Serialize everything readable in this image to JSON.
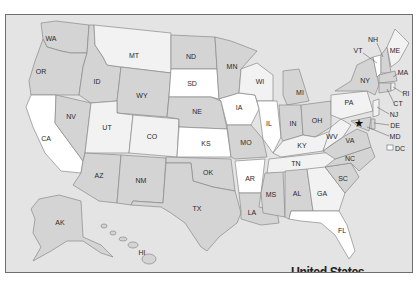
{
  "map": {
    "title": "United States",
    "colors": {
      "background": "#e4e4e4",
      "white": "#ffffff",
      "light": "#f2f2f2",
      "medium": "#d4d4d4",
      "border": "#8a8a8a",
      "frame": "#6e6e6e"
    },
    "capital_marker": "star-icon",
    "states": [
      {
        "abbr": "WA",
        "x": 50,
        "y": 38
      },
      {
        "abbr": "OR",
        "x": 40,
        "y": 71
      },
      {
        "abbr": "CA",
        "x": 45,
        "y": 138
      },
      {
        "abbr": "NV",
        "x": 70,
        "y": 116
      },
      {
        "abbr": "ID",
        "x": 96,
        "y": 81
      },
      {
        "abbr": "MT",
        "x": 133,
        "y": 55
      },
      {
        "abbr": "WY",
        "x": 141,
        "y": 95
      },
      {
        "abbr": "UT",
        "x": 106,
        "y": 127
      },
      {
        "abbr": "CO",
        "x": 151,
        "y": 136
      },
      {
        "abbr": "AZ",
        "x": 98,
        "y": 175
      },
      {
        "abbr": "NM",
        "x": 140,
        "y": 180
      },
      {
        "abbr": "ND",
        "x": 190,
        "y": 56
      },
      {
        "abbr": "SD",
        "x": 191,
        "y": 83
      },
      {
        "abbr": "NE",
        "x": 196,
        "y": 111
      },
      {
        "abbr": "KS",
        "x": 205,
        "y": 143
      },
      {
        "abbr": "OK",
        "x": 207,
        "y": 172
      },
      {
        "abbr": "TX",
        "x": 196,
        "y": 208
      },
      {
        "abbr": "MN",
        "x": 231,
        "y": 66
      },
      {
        "abbr": "IA",
        "x": 238,
        "y": 107
      },
      {
        "abbr": "MO",
        "x": 245,
        "y": 142
      },
      {
        "abbr": "AR",
        "x": 249,
        "y": 178
      },
      {
        "abbr": "LA",
        "x": 251,
        "y": 212
      },
      {
        "abbr": "WI",
        "x": 259,
        "y": 81
      },
      {
        "abbr": "IL",
        "x": 268,
        "y": 123
      },
      {
        "abbr": "MI",
        "x": 299,
        "y": 92
      },
      {
        "abbr": "IN",
        "x": 292,
        "y": 123
      },
      {
        "abbr": "OH",
        "x": 316,
        "y": 120
      },
      {
        "abbr": "KY",
        "x": 301,
        "y": 145
      },
      {
        "abbr": "TN",
        "x": 295,
        "y": 163
      },
      {
        "abbr": "MS",
        "x": 270,
        "y": 194
      },
      {
        "abbr": "AL",
        "x": 296,
        "y": 193
      },
      {
        "abbr": "GA",
        "x": 321,
        "y": 193
      },
      {
        "abbr": "FL",
        "x": 341,
        "y": 230
      },
      {
        "abbr": "SC",
        "x": 342,
        "y": 178
      },
      {
        "abbr": "NC",
        "x": 349,
        "y": 158
      },
      {
        "abbr": "VA",
        "x": 349,
        "y": 140
      },
      {
        "abbr": "WV",
        "x": 331,
        "y": 136
      },
      {
        "abbr": "PA",
        "x": 348,
        "y": 102
      },
      {
        "abbr": "NY",
        "x": 364,
        "y": 80
      },
      {
        "abbr": "VT",
        "x": 357,
        "y": 50
      },
      {
        "abbr": "NH",
        "x": 372,
        "y": 39
      },
      {
        "abbr": "ME",
        "x": 394,
        "y": 50
      },
      {
        "abbr": "MA",
        "x": 402,
        "y": 72
      },
      {
        "abbr": "RI",
        "x": 405,
        "y": 93
      },
      {
        "abbr": "CT",
        "x": 397,
        "y": 103
      },
      {
        "abbr": "NJ",
        "x": 393,
        "y": 114
      },
      {
        "abbr": "DE",
        "x": 394,
        "y": 125
      },
      {
        "abbr": "MD",
        "x": 394,
        "y": 136
      },
      {
        "abbr": "DC",
        "x": 399,
        "y": 148
      },
      {
        "abbr": "AK",
        "x": 59,
        "y": 222
      },
      {
        "abbr": "HI",
        "x": 141,
        "y": 252
      }
    ]
  }
}
